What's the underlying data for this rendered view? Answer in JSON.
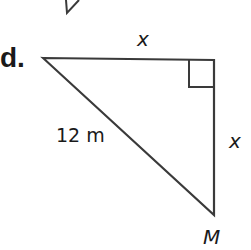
{
  "problem": {
    "part_label": "d.",
    "labels": {
      "top_side": "x",
      "hypotenuse": "12 m",
      "right_side": "x",
      "vertex_bottom": "M"
    },
    "colors": {
      "stroke": "#3a3a3a",
      "text": "#1a1a1a"
    }
  }
}
